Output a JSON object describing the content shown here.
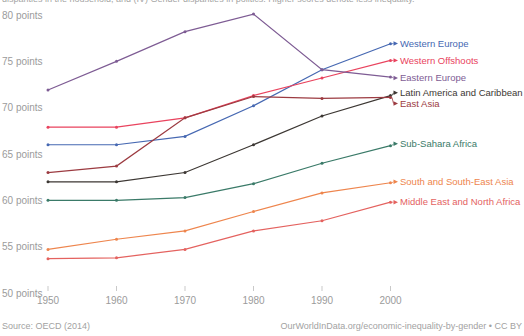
{
  "subtitle_clipped": "disparities in the household, and (IV) Gender disparities in politics. Higher scores denote less inequality.",
  "footer": {
    "source": "Source: OECD (2014)",
    "credit": "OurWorldInData.org/economic-inequality-by-gender • CC BY"
  },
  "colors": {
    "axis_text": "#9b9b9b",
    "tick_mark": "#c9c9c9",
    "footer_text": "#a2a2a2",
    "background": "#ffffff"
  },
  "chart_data": {
    "type": "line",
    "title": "",
    "xlabel": "",
    "ylabel": "points",
    "x": [
      1950,
      1960,
      1970,
      1980,
      1990,
      2000
    ],
    "x_tick_labels": [
      "1950",
      "1960",
      "1970",
      "1980",
      "1990",
      "2000"
    ],
    "y_ticks": [
      80,
      75,
      70,
      65,
      60,
      55,
      50
    ],
    "y_tick_suffix": " points",
    "ylim": [
      50,
      81
    ],
    "grid": false,
    "legend_position": "line-end-labels-right",
    "series": [
      {
        "name": "Western Europe",
        "color": "#4668b2",
        "values": [
          66.0,
          66.0,
          66.9,
          70.2,
          74.1,
          76.9
        ],
        "label_dy": -0.2
      },
      {
        "name": "Western Offshoots",
        "color": "#e9435e",
        "values": [
          67.9,
          67.9,
          68.9,
          71.3,
          73.2,
          75.1
        ],
        "label_dy": 0
      },
      {
        "name": "Eastern Europe",
        "color": "#7e5c94",
        "values": [
          71.9,
          75.0,
          78.2,
          80.1,
          74.1,
          73.3
        ],
        "label_dy": 0.9
      },
      {
        "name": "Latin America and Caribbean",
        "color": "#3c3733",
        "values": [
          62.0,
          62.0,
          63.0,
          66.0,
          69.1,
          71.3
        ],
        "label_dy": -2.8
      },
      {
        "name": "East Asia",
        "color": "#9c3b41",
        "values": [
          63.0,
          63.7,
          68.9,
          71.2,
          71.0,
          71.1
        ],
        "label_dy": 6.0
      },
      {
        "name": "Sub-Sahara Africa",
        "color": "#3a7a68",
        "values": [
          60.0,
          60.0,
          60.3,
          61.8,
          64.0,
          65.9
        ],
        "label_dy": -1.9
      },
      {
        "name": "South and South-East Asia",
        "color": "#ee854d",
        "values": [
          54.7,
          55.8,
          56.7,
          58.8,
          60.8,
          61.9
        ],
        "label_dy": -1.0
      },
      {
        "name": "Middle East and North Africa",
        "color": "#e4625f",
        "values": [
          53.7,
          53.8,
          54.7,
          56.7,
          57.8,
          59.8
        ],
        "label_dy": 0
      }
    ]
  }
}
